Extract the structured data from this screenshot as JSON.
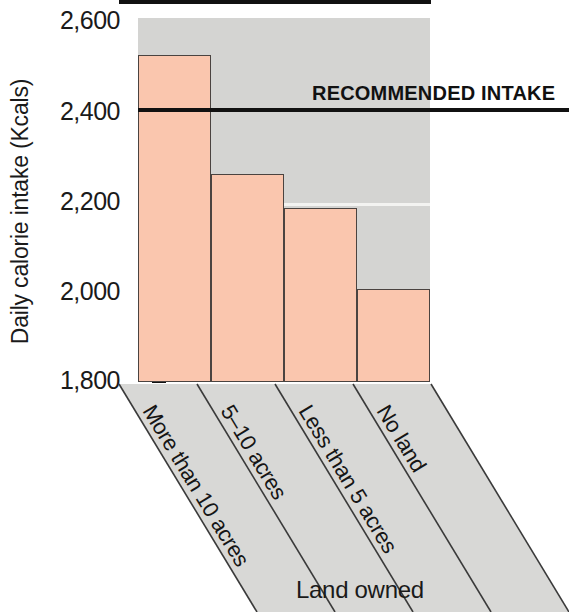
{
  "chart_data": {
    "type": "bar",
    "title": "",
    "xlabel": "Land owned",
    "ylabel": "Daily calorie intake (Kcals)",
    "categories": [
      "More than 10 acres",
      "5–10 acres",
      "Less than 5 acres",
      "No land"
    ],
    "values": [
      2518,
      2258,
      2183,
      2005
    ],
    "ylim": [
      1800,
      2600
    ],
    "yticks": [
      2600,
      2400,
      2200,
      2000,
      1800
    ],
    "ytick_labels": [
      "2,600",
      "2,400",
      "2,200",
      "2,000",
      "1,800"
    ],
    "grid": true,
    "legend": "none",
    "annotations": [
      {
        "name": "recommended-intake",
        "label": "RECOMMENDED INTAKE",
        "type": "horizontal-line",
        "value": 2400
      }
    ],
    "colors": {
      "bar_fill": "#fac6ae",
      "bar_edge": "#4a4340",
      "panel_background": "#d4d4d2",
      "gridline": "#f3f3f1",
      "axis": "#111111",
      "text": "#1a1a1a"
    }
  },
  "axes": {
    "y_title": "Daily calorie intake (Kcals)",
    "x_title": "Land owned",
    "y_tick_labels": [
      "2,600",
      "2,400",
      "2,200",
      "2,000",
      "1,800"
    ]
  },
  "categories": [
    {
      "label": "More than 10 acres"
    },
    {
      "label": "5–10 acres"
    },
    {
      "label": "Less than 5 acres"
    },
    {
      "label": "No land"
    }
  ],
  "reference": {
    "label": "RECOMMENDED INTAKE",
    "value": "2400"
  }
}
